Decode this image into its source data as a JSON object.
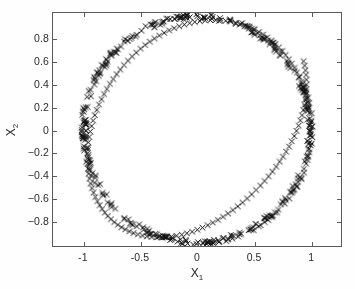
{
  "figure": {
    "background_color": "#fefefe",
    "axes_color": "#5a5a5a",
    "marker_color": "#111111"
  },
  "axis": {
    "xlabel_base": "X",
    "xlabel_sub": "1",
    "ylabel_base": "X",
    "ylabel_sub": "2"
  },
  "chart_data": {
    "type": "scatter",
    "title": "",
    "xlabel": "X1",
    "ylabel": "X2",
    "xlim": [
      -1.27,
      1.27
    ],
    "ylim": [
      -1.03,
      1.03
    ],
    "xticks": [
      -1,
      -0.5,
      0,
      0.5,
      1
    ],
    "xticklabels": [
      "-1",
      "-0.5",
      "0",
      "0.5",
      "1"
    ],
    "yticks": [
      0.8,
      0.6,
      0.4,
      0.2,
      0,
      -0.2,
      -0.4,
      -0.6,
      -0.8
    ],
    "yticklabels": [
      "0.8",
      "0.6",
      "0.4",
      "0.2",
      "0",
      "-0.2",
      "-0.4",
      "-0.6",
      "-0.8"
    ],
    "grid": false,
    "legend": null,
    "marker": "x",
    "marker_size": 4,
    "marker_color": "#111111",
    "n_points": 520,
    "geometry": {
      "shape": "circle",
      "center": [
        0,
        0
      ],
      "radius": 1.0,
      "radial_jitter": 0.022,
      "angular_coverage_deg": 360
    },
    "x": [
      1.0,
      0.999,
      0.996,
      0.991,
      0.984,
      0.976,
      0.965,
      0.952,
      0.938,
      0.921,
      0.903,
      0.882,
      0.86,
      0.836,
      0.81,
      0.782,
      0.753,
      0.722,
      0.69,
      0.656,
      0.62,
      0.584,
      0.546,
      0.507,
      0.466,
      0.425,
      0.383,
      0.34,
      0.296,
      0.252,
      0.208,
      0.163,
      0.117,
      0.072,
      0.026,
      -0.02,
      -0.065,
      -0.111,
      -0.156,
      -0.201,
      -0.245,
      -0.289,
      -0.332,
      -0.375,
      -0.416,
      -0.457,
      -0.497,
      -0.535,
      -0.573,
      -0.609,
      -0.644,
      -0.677,
      -0.709,
      -0.739,
      -0.768,
      -0.795,
      -0.82,
      -0.843,
      -0.865,
      -0.884,
      -0.902,
      -0.917,
      -0.93,
      -0.942,
      -0.951,
      -0.958,
      -0.963,
      -0.966,
      -0.967,
      -0.966,
      -0.962,
      -0.957,
      -0.949,
      -0.939,
      -0.927,
      -0.913,
      -0.897,
      -0.879,
      -0.859,
      -0.837,
      -0.813,
      -0.787,
      -0.759,
      -0.73,
      -0.699,
      -0.666,
      -0.632,
      -0.596,
      -0.559,
      -0.521,
      -0.481,
      -0.441,
      -0.399,
      -0.357,
      -0.313,
      -0.269,
      -0.225,
      -0.18,
      -0.134,
      -0.089,
      -0.043,
      0.003,
      0.048,
      0.094,
      0.139,
      0.184,
      0.229,
      0.273,
      0.316,
      0.359,
      0.401,
      0.442,
      0.482,
      0.521,
      0.559,
      0.596,
      0.631,
      0.665,
      0.698,
      0.729,
      0.758,
      0.786,
      0.812,
      0.836,
      0.858,
      0.878,
      0.896,
      0.912,
      0.926,
      0.938,
      0.948,
      0.955,
      0.961,
      0.964,
      0.966,
      0.965,
      0.962,
      0.957,
      0.95,
      0.94
    ],
    "y": [
      0.0,
      0.048,
      0.096,
      0.144,
      0.191,
      0.238,
      0.284,
      0.33,
      0.375,
      0.419,
      0.462,
      0.504,
      0.545,
      0.584,
      0.622,
      0.659,
      0.694,
      0.727,
      0.758,
      0.787,
      0.815,
      0.84,
      0.863,
      0.884,
      0.903,
      0.919,
      0.933,
      0.945,
      0.954,
      0.961,
      0.965,
      0.967,
      0.967,
      0.964,
      0.958,
      0.951,
      0.941,
      0.928,
      0.913,
      0.896,
      0.877,
      0.855,
      0.831,
      0.805,
      0.777,
      0.747,
      0.715,
      0.681,
      0.646,
      0.609,
      0.57,
      0.53,
      0.489,
      0.446,
      0.403,
      0.358,
      0.313,
      0.267,
      0.22,
      0.173,
      0.126,
      0.078,
      0.03,
      -0.018,
      -0.066,
      -0.114,
      -0.161,
      -0.208,
      -0.255,
      -0.301,
      -0.346,
      -0.391,
      -0.434,
      -0.477,
      -0.518,
      -0.558,
      -0.597,
      -0.634,
      -0.669,
      -0.703,
      -0.735,
      -0.765,
      -0.793,
      -0.819,
      -0.843,
      -0.865,
      -0.884,
      -0.901,
      -0.916,
      -0.928,
      -0.938,
      -0.946,
      -0.951,
      -0.954,
      -0.954,
      -0.952,
      -0.947,
      -0.94,
      -0.93,
      -0.918,
      -0.904,
      -0.887,
      -0.868,
      -0.847,
      -0.824,
      -0.799,
      -0.772,
      -0.743,
      -0.712,
      -0.68,
      -0.646,
      -0.61,
      -0.573,
      -0.535,
      -0.496,
      -0.455,
      -0.414,
      -0.371,
      -0.328,
      -0.284,
      -0.24,
      -0.195,
      -0.15,
      -0.104,
      -0.058,
      -0.012,
      0.034,
      0.08,
      0.126,
      0.172,
      0.218,
      0.263,
      0.308,
      0.353,
      0.397,
      0.44,
      0.483,
      0.524,
      0.565,
      0.604
    ]
  }
}
